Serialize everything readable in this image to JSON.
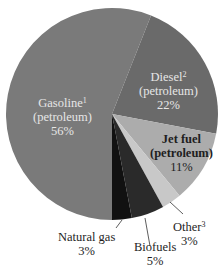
{
  "chart_data": {
    "type": "pie",
    "title": "",
    "center": [
      112,
      114
    ],
    "radius": 106,
    "start_angle_deg": 180,
    "direction": "clockwise",
    "slices": [
      {
        "name": "Gasoline",
        "footnote": "1",
        "sub": "(petroleum)",
        "value": 56,
        "label": "56%",
        "color": "#7a7a7a"
      },
      {
        "name": "Diesel",
        "footnote": "2",
        "sub": "(petroleum)",
        "value": 22,
        "label": "22%",
        "color": "#6a6a6a"
      },
      {
        "name": "Jet fuel",
        "footnote": "",
        "sub": "(petroleum)",
        "value": 11,
        "label": "11%",
        "color": "#acacac"
      },
      {
        "name": "Other",
        "footnote": "3",
        "sub": "",
        "value": 3,
        "label": "3%",
        "color": "#c8c8c8"
      },
      {
        "name": "Biofuels",
        "footnote": "",
        "sub": "",
        "value": 5,
        "label": "5%",
        "color": "#2a2a2a"
      },
      {
        "name": "Natural gas",
        "footnote": "",
        "sub": "",
        "value": 3,
        "label": "3%",
        "color": "#111111"
      }
    ]
  },
  "labels": {
    "gasoline": {
      "name": "Gasoline",
      "sup": "1",
      "sub": "(petroleum)",
      "pct": "56%"
    },
    "diesel": {
      "name": "Diesel",
      "sup": "2",
      "sub": "(petroleum)",
      "pct": "22%"
    },
    "jet": {
      "name": "Jet fuel",
      "sub": "(petroleum)",
      "pct": "11%"
    },
    "other": {
      "name": "Other",
      "sup": "3",
      "pct": "3%"
    },
    "biofuels": {
      "name": "Biofuels",
      "pct": "5%"
    },
    "natgas": {
      "name": "Natural gas",
      "pct": "3%"
    }
  }
}
